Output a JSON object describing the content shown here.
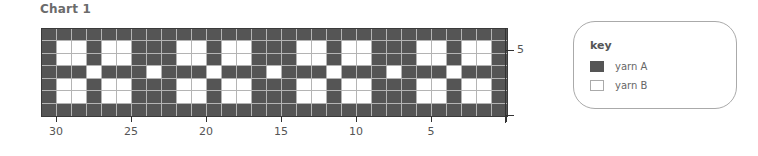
{
  "chart_data": {
    "type": "heatmap",
    "title": "Chart 1",
    "subtype": "knitting colorwork chart",
    "columns": 31,
    "rows": 7,
    "x_ticks": [
      {
        "label": "30",
        "stitch_boundary": 30
      },
      {
        "label": "25",
        "stitch_boundary": 25
      },
      {
        "label": "20",
        "stitch_boundary": 20
      },
      {
        "label": "15",
        "stitch_boundary": 15
      },
      {
        "label": "10",
        "stitch_boundary": 10
      },
      {
        "label": "5",
        "stitch_boundary": 5
      },
      {
        "label": "",
        "stitch_boundary": 0
      }
    ],
    "y_ticks": [
      {
        "label": "5",
        "row_boundary": 5
      },
      {
        "label": "",
        "row_boundary": 0
      }
    ],
    "legend": [
      {
        "code": "A",
        "label": "yarn A",
        "color": "#555555"
      },
      {
        "code": "B",
        "label": "yarn B",
        "color": "#ffffff"
      }
    ],
    "grid_top_to_bottom": [
      "AAAAAAAAAAAAAAAAAAAAAAAAAAAAAAA",
      "ABBABBAAABBABBAAABBABBAAABBABBA",
      "ABBABBAAABBABBAAABBABBAAABBABBA",
      "AAABAAABAAABAAABAAABAAABAAABAAA",
      "ABBABBAAABBABBAAABBABBAAABBABBA",
      "ABBABBAAABBABBAAABBABBAAABBABBA",
      "AAAAAAAAAAAAAAAAAAAAAAAAAAAAAAA"
    ]
  },
  "title": "Chart 1",
  "key": {
    "title": "key",
    "items": [
      {
        "label": "yarn A",
        "color": "#555555"
      },
      {
        "label": "yarn B",
        "color": "#ffffff"
      }
    ]
  },
  "axis": {
    "x_labels": [
      "30",
      "25",
      "20",
      "15",
      "10",
      "5"
    ],
    "y_label": "5"
  }
}
